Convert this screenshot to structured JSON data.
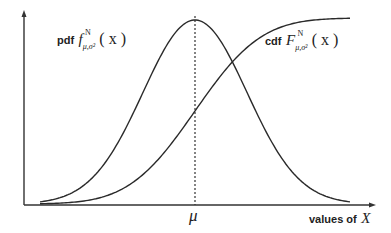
{
  "figure": {
    "pdf_label": {
      "prefix": "pdf",
      "func": "f",
      "superscript": "N",
      "subscript": "μ,σ²",
      "arg": "( x )"
    },
    "cdf_label": {
      "prefix": "cdf",
      "func": "F",
      "superscript": "N",
      "subscript": "μ,σ²",
      "arg": "( x )"
    },
    "mu_label": "μ",
    "x_axis_label": {
      "text": "values of",
      "var": "X"
    }
  },
  "chart_data": {
    "type": "line",
    "title": "",
    "xlabel": "values of X",
    "ylabel": "",
    "x_ticks": [
      "μ"
    ],
    "series": [
      {
        "name": "pdf f^N_{μ,σ²}(x)",
        "shape": "bell curve (normal density), peak at x = μ"
      },
      {
        "name": "cdf F^N_{μ,σ²}(x)",
        "shape": "sigmoid (normal CDF), value 0.5 at x = μ, approaches 1"
      }
    ],
    "annotations": [
      "dashed vertical line at x = μ"
    ],
    "grid": false,
    "legend": "inline labels"
  },
  "colors": {
    "line": "#2a2a2a",
    "axis": "#333333",
    "background": "#ffffff"
  }
}
